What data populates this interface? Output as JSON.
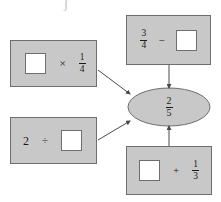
{
  "diagram": {
    "type": "concept-map",
    "center": {
      "label": "2/5",
      "numerator": "2",
      "denominator": "5",
      "shape": "ellipse",
      "fill": "#c8c8c8",
      "stroke": "#6e6e6e"
    },
    "nodes": [
      {
        "id": "multiplication",
        "name": "multiplication-expression-box",
        "position": "top-left",
        "expression": {
          "left": {
            "kind": "blank",
            "value": ""
          },
          "operator": "×",
          "operator_name": "multiplication-sign",
          "right": {
            "kind": "fraction",
            "numerator": "1",
            "denominator": "4"
          }
        }
      },
      {
        "id": "division",
        "name": "division-expression-box",
        "position": "bottom-left",
        "expression": {
          "left": {
            "kind": "number",
            "value": "2"
          },
          "operator": "÷",
          "operator_name": "division-sign",
          "right": {
            "kind": "blank",
            "value": ""
          }
        }
      },
      {
        "id": "subtraction",
        "name": "subtraction-expression-box",
        "position": "top-right",
        "expression": {
          "left": {
            "kind": "fraction",
            "numerator": "3",
            "denominator": "4"
          },
          "operator": "−",
          "operator_name": "minus-sign",
          "right": {
            "kind": "blank",
            "value": ""
          }
        }
      },
      {
        "id": "addition",
        "name": "addition-expression-box",
        "position": "bottom-right",
        "expression": {
          "left": {
            "kind": "blank",
            "value": ""
          },
          "operator": "+",
          "operator_name": "plus-sign",
          "right": {
            "kind": "fraction",
            "numerator": "1",
            "denominator": "3"
          }
        }
      }
    ],
    "arrows": [
      {
        "name": "arrow-multiplication-to-center",
        "from": "multiplication",
        "to": "center",
        "direction": "down-right"
      },
      {
        "name": "arrow-division-to-center",
        "from": "division",
        "to": "center",
        "direction": "up-right"
      },
      {
        "name": "arrow-subtraction-to-center",
        "from": "subtraction",
        "to": "center",
        "direction": "down"
      },
      {
        "name": "arrow-addition-to-center",
        "from": "addition",
        "to": "center",
        "direction": "up"
      }
    ],
    "colors": {
      "box_fill": "#c8c8c8",
      "box_stroke": "#6e6e6e",
      "slot_fill": "#ffffff",
      "ink": "#1a1a1a",
      "background": "#ffffff"
    },
    "stray_mark": "ʃ"
  }
}
